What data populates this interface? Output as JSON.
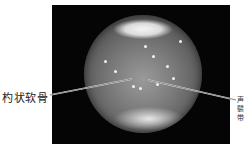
{
  "figure": {
    "type": "endoscopic-photograph",
    "labels": {
      "left": "杓状软骨",
      "right_partial": "声\n襞\n带"
    }
  }
}
